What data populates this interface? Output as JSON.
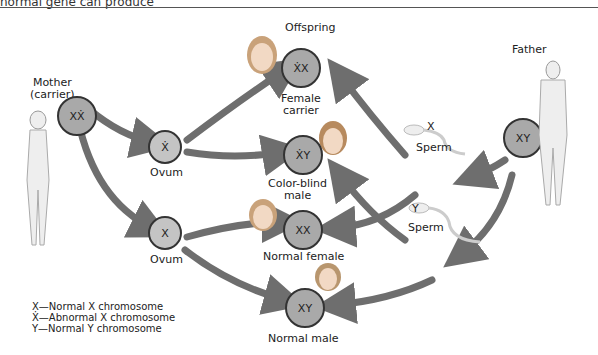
{
  "caption": "normal gene can produce",
  "parents": {
    "mother": {
      "label": "Mother",
      "sublabel": "(carrier)",
      "genotype": "XẊ"
    },
    "father": {
      "label": "Father",
      "genotype": "XY"
    }
  },
  "gametes": {
    "ovum1": {
      "label": "Ovum",
      "genotype": "Ẋ"
    },
    "ovum2": {
      "label": "Ovum",
      "genotype": "X"
    },
    "sperm_x": {
      "label": "Sperm",
      "genotype": "X"
    },
    "sperm_y": {
      "label": "Sperm",
      "genotype": "Y"
    }
  },
  "offspring": {
    "title": "Offspring",
    "female_carrier": {
      "genotype": "ẊX",
      "label_line1": "Female",
      "label_line2": "carrier"
    },
    "colorblind_male": {
      "genotype": "ẊY",
      "label_line1": "Color-blind",
      "label_line2": "male"
    },
    "normal_female": {
      "genotype": "XX",
      "label": "Normal female"
    },
    "normal_male": {
      "genotype": "XY",
      "label": "Normal male"
    }
  },
  "legend": [
    {
      "symbol": "X",
      "text": "—Normal X chromosome"
    },
    {
      "symbol": "Ẋ",
      "text": "—Abnormal X chromosome"
    },
    {
      "symbol": "Y",
      "text": "—Normal Y chromosome"
    }
  ],
  "colors": {
    "arrow": "#6e6e6e",
    "circle": "#a9a9a9",
    "circle_light": "#c4c4c4",
    "outline": "#333333"
  }
}
